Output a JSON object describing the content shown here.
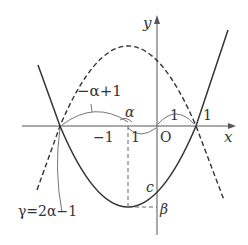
{
  "diagram": {
    "type": "function-graph",
    "axes": {
      "x_label": "x",
      "y_label": "y",
      "origin_label": "O"
    },
    "curves": [
      {
        "name": "solid-parabola",
        "style": "solid",
        "opens": "up"
      },
      {
        "name": "dashed-parabola",
        "style": "dashed",
        "opens": "down"
      }
    ],
    "labels": {
      "neg_alpha_plus_1": "−α+1",
      "alpha": "α",
      "one_left": "1",
      "one_mid": "1",
      "one_right": "1",
      "neg_one": "−1",
      "c": "c",
      "beta": "β",
      "gamma_eq": "γ=2α−1"
    },
    "colors": {
      "ink": "#333333",
      "thin": "#666666"
    }
  }
}
